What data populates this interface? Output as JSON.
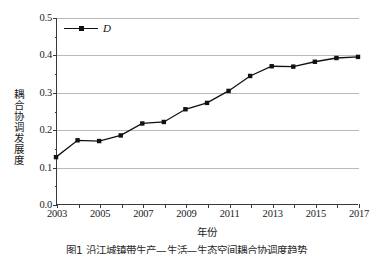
{
  "figure": {
    "background_color": "#ffffff",
    "caption": "图1  沿江城镇带生产—生活—生态空间耦合协调度趋势"
  },
  "legend": {
    "entries": [
      {
        "label": "D",
        "color": "#111111",
        "marker": "square"
      }
    ]
  },
  "axes": {
    "y": {
      "title": "耦合协调发展度",
      "ticks": [
        "0.5",
        "0.4",
        "0.3",
        "0.2",
        "0.1",
        "0.0"
      ],
      "min": 0.0,
      "max": 0.5
    },
    "x": {
      "title": "年份",
      "ticks": [
        "2003",
        "2005",
        "2007",
        "2009",
        "2011",
        "2013",
        "2015",
        "2017"
      ],
      "min": 2003,
      "max": 2017
    }
  },
  "chart_data": {
    "type": "line",
    "title": "",
    "xlabel": "年份",
    "ylabel": "耦合协调发展度",
    "xlim": [
      2003,
      2017
    ],
    "ylim": [
      0.0,
      0.5
    ],
    "grid": "horizontal",
    "legend_position": "top-left",
    "x": [
      2003,
      2004,
      2005,
      2006,
      2007,
      2008,
      2009,
      2010,
      2011,
      2012,
      2013,
      2014,
      2015,
      2016,
      2017
    ],
    "series": [
      {
        "name": "D",
        "color": "#111111",
        "marker": "square",
        "values": [
          0.128,
          0.173,
          0.171,
          0.186,
          0.218,
          0.222,
          0.256,
          0.273,
          0.305,
          0.345,
          0.371,
          0.37,
          0.383,
          0.393,
          0.396
        ]
      }
    ]
  }
}
